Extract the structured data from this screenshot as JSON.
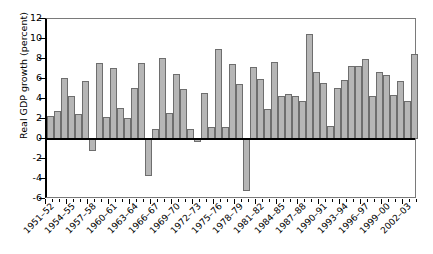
{
  "chart_data": {
    "type": "bar",
    "title": "",
    "xlabel": "",
    "ylabel": "Real GDP growth (percent)",
    "ylim": [
      -6,
      12
    ],
    "ytick_values": [
      12,
      10,
      8,
      6,
      4,
      2,
      0,
      -2,
      -4,
      -6
    ],
    "ytick_labels": [
      "12",
      "10",
      "8",
      "6",
      "4",
      "2",
      "0",
      "-2",
      "-4",
      "-6"
    ],
    "grid": false,
    "legend": "none",
    "bar_color": "#b6b6b6",
    "bar_edge_color": "#6e6e6e",
    "zero_line_color": "#000000",
    "categories": [
      "1951-52",
      "1952-53",
      "1953-54",
      "1954-55",
      "1955-56",
      "1956-57",
      "1957-58",
      "1958-59",
      "1959-60",
      "1960-61",
      "1961-62",
      "1962-63",
      "1963-64",
      "1964-65",
      "1965-66",
      "1966-67",
      "1967-68",
      "1968-69",
      "1969-70",
      "1970-71",
      "1971-72",
      "1972-73",
      "1973-74",
      "1974-75",
      "1975-76",
      "1976-77",
      "1977-78",
      "1978-79",
      "1979-80",
      "1980-81",
      "1981-82",
      "1982-83",
      "1983-84",
      "1984-85",
      "1985-86",
      "1986-87",
      "1987-88",
      "1988-89",
      "1989-90",
      "1990-91",
      "1991-92",
      "1992-93",
      "1993-94",
      "1994-95",
      "1995-96",
      "1996-97",
      "1997-98",
      "1998-99",
      "1999-00",
      "2000-01",
      "2001-02",
      "2002-03",
      "2003-04"
    ],
    "values": [
      2.3,
      2.8,
      6.1,
      4.3,
      2.5,
      5.8,
      -1.2,
      7.6,
      2.2,
      7.1,
      3.1,
      2.1,
      5.1,
      7.6,
      -3.7,
      1.0,
      8.1,
      2.6,
      6.5,
      5.0,
      1.0,
      -0.3,
      4.6,
      1.2,
      9.0,
      1.2,
      7.5,
      5.5,
      -5.2,
      7.2,
      6.0,
      3.0,
      7.7,
      4.3,
      4.5,
      4.3,
      3.8,
      10.5,
      6.7,
      5.6,
      1.3,
      5.1,
      5.9,
      7.3,
      7.3,
      8.0,
      4.3,
      6.7,
      6.4,
      4.4,
      5.8,
      3.8,
      8.5
    ],
    "xtick_labels": [
      "1951–52",
      "1954–55",
      "1957–58",
      "1960–61",
      "1963–64",
      "1966–67",
      "1969–70",
      "1972–73",
      "1975–76",
      "1978–79",
      "1981–82",
      "1984–85",
      "1987–88",
      "1990–91",
      "1993–94",
      "1996–97",
      "1999–00",
      "2002–03"
    ],
    "xtick_indices": [
      0,
      3,
      6,
      9,
      12,
      15,
      18,
      21,
      24,
      27,
      30,
      33,
      36,
      39,
      42,
      45,
      48,
      51
    ]
  }
}
